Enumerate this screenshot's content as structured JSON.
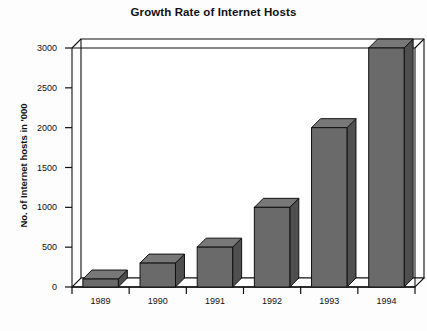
{
  "chart_data": {
    "type": "bar",
    "title": "Growth Rate of Internet Hosts",
    "xlabel": "",
    "ylabel": "No. of Internet hosts in '000",
    "categories": [
      "1989",
      "1990",
      "1991",
      "1992",
      "1993",
      "1994"
    ],
    "values": [
      100,
      300,
      500,
      1000,
      2000,
      3000
    ],
    "series": [
      {
        "name": "No. of Internet hosts in '000",
        "values": [
          100,
          300,
          500,
          1000,
          2000,
          3000
        ]
      }
    ],
    "ylim": [
      0,
      3000
    ],
    "yticks": [
      0,
      500,
      1000,
      1500,
      2000,
      2500,
      3000
    ],
    "ytick_labels": [
      "0",
      "500",
      "1000",
      "1500",
      "2000",
      "2500",
      "3000"
    ],
    "grid": false,
    "legend": false,
    "legend_position": "none",
    "style": "3d-blocks",
    "colors": {
      "bar_front": "#6a6a6a",
      "bar_top": "#787878",
      "bar_side": "#4f4f4f",
      "outline": "#111111",
      "axis": "#111111",
      "background": "#fdfdfd",
      "plot_area": "#ffffff"
    }
  }
}
